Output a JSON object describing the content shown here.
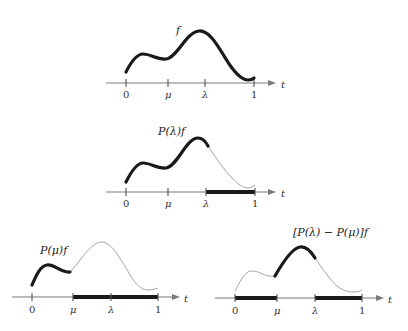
{
  "diagram": {
    "axis_variable": "t",
    "tick_labels": [
      "0",
      "μ",
      "λ",
      "1"
    ],
    "panels": [
      {
        "id": "top",
        "function_label": "f",
        "thick_curve_range": [
          "0",
          "1"
        ],
        "highlighted_axis_segments": []
      },
      {
        "id": "middle",
        "function_label": "P(λ)f",
        "thick_curve_range": [
          "0",
          "λ"
        ],
        "highlighted_axis_segments": [
          [
            "λ",
            "1"
          ]
        ]
      },
      {
        "id": "bottom-left",
        "function_label": "P(μ)f",
        "thick_curve_range": [
          "0",
          "μ"
        ],
        "highlighted_axis_segments": [
          [
            "μ",
            "1"
          ]
        ]
      },
      {
        "id": "bottom-right",
        "function_label": "[P(λ) − P(μ)]f",
        "thick_curve_range": [
          "μ",
          "λ"
        ],
        "highlighted_axis_segments": [
          [
            "0",
            "μ"
          ],
          [
            "λ",
            "1"
          ]
        ]
      }
    ]
  }
}
